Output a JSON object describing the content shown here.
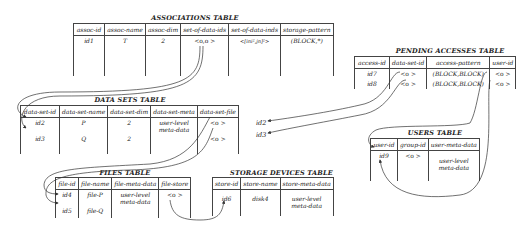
{
  "associations": {
    "title": "ASSOCIATIONS TABLE",
    "columns": [
      "assoc-id",
      "assoc-name",
      "assoc-dim",
      "set-of-data-ids",
      "set-of-data-inds",
      "storage-pattern"
    ],
    "rows": [
      [
        "id1",
        "T",
        "2",
        "<o,o >",
        "<[ini²,jn]²>",
        "(BLOCK,*)"
      ]
    ]
  },
  "pending": {
    "title": "PENDING ACCESSES TABLE",
    "columns": [
      "access-id",
      "data-set-id",
      "access-pattern",
      "user-id"
    ],
    "rows": [
      [
        "id7",
        "<o >",
        "(BLOCK,BLOCK)",
        "<o >"
      ],
      [
        "id8",
        "<o >",
        "(BLOCK,BLOCK)",
        "<o >"
      ]
    ]
  },
  "datasets": {
    "title": "DATA SETS TABLE",
    "columns": [
      "data-set-id",
      "data-set-name",
      "data-set-dim",
      "data-set-meta",
      "data-set-file"
    ],
    "rows": [
      [
        "id2",
        "P",
        "2",
        "user-level meta-data",
        "<o >"
      ],
      [
        "id3",
        "Q",
        "2",
        "",
        "<o >"
      ]
    ]
  },
  "loose_ids": [
    "id2",
    "id3"
  ],
  "users": {
    "title": "USERS TABLE",
    "columns": [
      "user-id",
      "group-id",
      "user-meta-data"
    ],
    "rows": [
      [
        "id9",
        "<o >",
        "user-level meta-data"
      ]
    ]
  },
  "files": {
    "title": "FILES TABLE",
    "columns": [
      "file-id",
      "file-name",
      "file-meta-data",
      "file-store"
    ],
    "rows": [
      [
        "id4",
        "file-P",
        "user-level meta-data",
        "<o >"
      ],
      [
        "id5",
        "file-Q",
        "",
        ""
      ]
    ]
  },
  "storage": {
    "title": "STORAGE DEVICES TABLE",
    "columns": [
      "store-id",
      "store-name",
      "store-meta-data"
    ],
    "rows": [
      [
        "id6",
        "disk4",
        "user-level meta-data"
      ]
    ]
  }
}
